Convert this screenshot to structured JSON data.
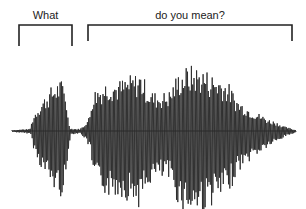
{
  "figure": {
    "segments": [
      {
        "label": "What",
        "x_start": 19,
        "x_end": 72,
        "bracket_top": 25,
        "bracket_bottom": 46
      },
      {
        "label": "do you mean?",
        "x_start": 88,
        "x_end": 292,
        "bracket_top": 25,
        "bracket_bottom": 41
      }
    ],
    "waveform": {
      "color": "#2a2a2a",
      "baseline_y": 131,
      "x_range": [
        12,
        296
      ],
      "envelope": [
        [
          12,
          1
        ],
        [
          20,
          2
        ],
        [
          30,
          3
        ],
        [
          33,
          20
        ],
        [
          36,
          30
        ],
        [
          40,
          40
        ],
        [
          45,
          50
        ],
        [
          50,
          60
        ],
        [
          55,
          68
        ],
        [
          60,
          72
        ],
        [
          63,
          70
        ],
        [
          66,
          55
        ],
        [
          68,
          20
        ],
        [
          70,
          4
        ],
        [
          75,
          3
        ],
        [
          80,
          3
        ],
        [
          84,
          8
        ],
        [
          86,
          14
        ],
        [
          88,
          16
        ],
        [
          90,
          25
        ],
        [
          92,
          50
        ],
        [
          96,
          62
        ],
        [
          100,
          65
        ],
        [
          105,
          70
        ],
        [
          110,
          75
        ],
        [
          115,
          72
        ],
        [
          120,
          72
        ],
        [
          125,
          75
        ],
        [
          130,
          78
        ],
        [
          135,
          80
        ],
        [
          140,
          85
        ],
        [
          145,
          72
        ],
        [
          150,
          58
        ],
        [
          155,
          55
        ],
        [
          160,
          55
        ],
        [
          165,
          55
        ],
        [
          170,
          58
        ],
        [
          175,
          75
        ],
        [
          180,
          85
        ],
        [
          185,
          90
        ],
        [
          190,
          92
        ],
        [
          195,
          92
        ],
        [
          200,
          90
        ],
        [
          205,
          88
        ],
        [
          210,
          82
        ],
        [
          215,
          80
        ],
        [
          220,
          78
        ],
        [
          225,
          72
        ],
        [
          230,
          65
        ],
        [
          235,
          50
        ],
        [
          240,
          42
        ],
        [
          245,
          38
        ],
        [
          250,
          32
        ],
        [
          255,
          28
        ],
        [
          260,
          24
        ],
        [
          265,
          20
        ],
        [
          270,
          16
        ],
        [
          275,
          14
        ],
        [
          280,
          10
        ],
        [
          285,
          6
        ],
        [
          290,
          4
        ],
        [
          296,
          1
        ]
      ]
    }
  }
}
